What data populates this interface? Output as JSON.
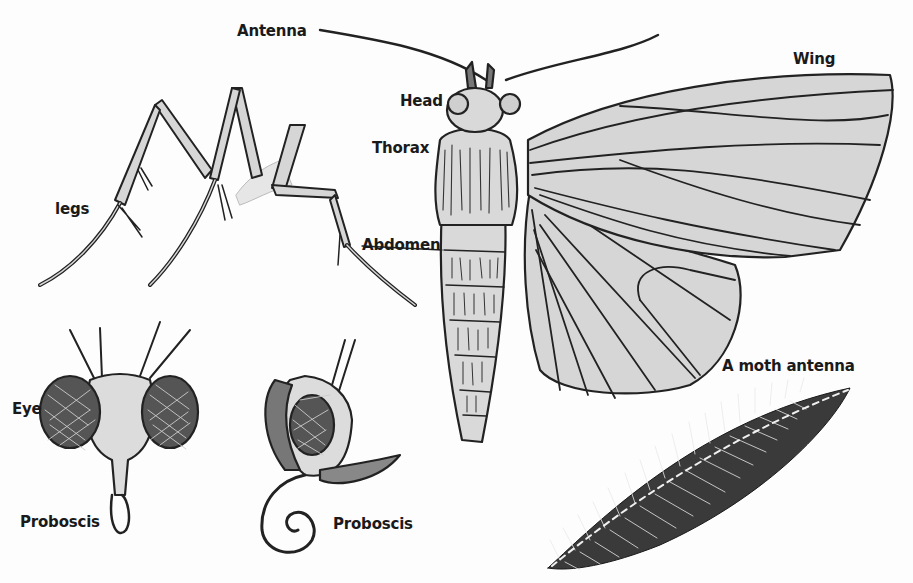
{
  "diagram": {
    "colors": {
      "fill": "#d4d4d4",
      "line": "#222222",
      "background": "#fdfdfd"
    },
    "labels": {
      "antenna": "Antenna",
      "head": "Head",
      "thorax": "Thorax",
      "abdomen": "Abdomen",
      "wing": "Wing",
      "legs": "legs",
      "eye": "Eye",
      "proboscis_front": "Proboscis",
      "proboscis_side": "Proboscis",
      "moth_antenna": "A moth antenna"
    },
    "panels": [
      "legs-illustration",
      "moth-body-with-wings",
      "head-front-view",
      "head-side-view",
      "feathered-antenna-detail"
    ]
  }
}
